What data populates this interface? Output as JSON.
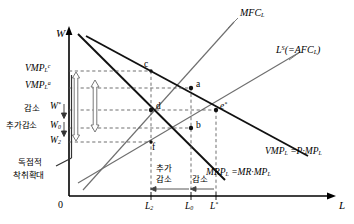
{
  "figure": {
    "type": "economics-diagram",
    "topic": "monopsony-labor-market",
    "axes": {
      "y_label": "W",
      "x_label": "L",
      "origin_label": "0"
    },
    "curves": [
      {
        "id": "mfc",
        "label_html": "MFC<sub>L</sub>",
        "name": "marginal-factor-cost"
      },
      {
        "id": "ls",
        "label_html": "L<sup>S</sup>(=AFC<sub>L</sub>)",
        "name": "labor-supply-average-factor-cost"
      },
      {
        "id": "vmp",
        "label_html": "VMP<sub>L</sub> =P&middot;MP<sub>L</sub>",
        "name": "value-of-marginal-product"
      },
      {
        "id": "mrp",
        "label_html": "MRP<sub>L</sub> =MR&middot;MP<sub>L</sub>",
        "name": "marginal-revenue-product"
      }
    ],
    "y_ticks": [
      {
        "id": "vmp_c",
        "label_html": "VMP<sub>L</sub><sup>c</sup>"
      },
      {
        "id": "vmp_a",
        "label_html": "VMP<sub>L</sub><sup>a</sup>"
      },
      {
        "id": "w_star",
        "label_html": "W<sup>*</sup>"
      },
      {
        "id": "w_0",
        "label_html": "W<sub>0</sub>"
      },
      {
        "id": "w_2",
        "label_html": "W<sub>2</sub>"
      }
    ],
    "x_ticks": [
      {
        "id": "l_2",
        "label_html": "L<sub>2</sub>"
      },
      {
        "id": "l_0",
        "label_html": "L<sub>0</sub>"
      },
      {
        "id": "l_star",
        "label_html": "L<sup>*</sup>"
      }
    ],
    "points": [
      {
        "id": "c",
        "label": "c"
      },
      {
        "id": "a",
        "label": "a"
      },
      {
        "id": "d",
        "label": "d"
      },
      {
        "id": "b",
        "label": "b"
      },
      {
        "id": "f",
        "label": "f"
      },
      {
        "id": "e_star",
        "label_html": "e<sup>*</sup>"
      }
    ],
    "annotations": {
      "wage_decrease": "감소",
      "wage_extra_decrease": "추가감소",
      "monopoly_line1": "독점적",
      "monopoly_line2": "착취확대",
      "emp_extra_decrease_line1": "추가",
      "emp_extra_decrease_line2": "감소",
      "emp_decrease": "감소"
    },
    "colors": {
      "ink": "#000000",
      "thin_line": "#7a7a7a",
      "dash": "#555555",
      "background": "#ffffff"
    }
  }
}
